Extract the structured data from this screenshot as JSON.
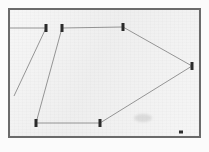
{
  "figure": {
    "kind": "scanned-survey-traverse-plot",
    "frame": {
      "x": 8,
      "y": 8,
      "width": 193,
      "height": 130,
      "border_color": "#6a6a6a",
      "border_width": 2
    },
    "background_color": "#ececec",
    "paper_color": "#fbfbfb",
    "line_color": "#8a8a8a",
    "node_color": "#2b2b2b"
  },
  "chart_data": {
    "type": "scatter",
    "title": "",
    "subtitle": "",
    "xlabel": "",
    "ylabel": "",
    "grid": false,
    "legend": null,
    "xlim": [
      0,
      209
    ],
    "ylim": [
      0,
      152
    ],
    "note": "Closed polygon traverse with station markers; coordinates are pixel positions in the scanned figure.",
    "nodes": [
      {
        "id": "A",
        "label": "",
        "x": 46,
        "y": 28
      },
      {
        "id": "B",
        "label": "",
        "x": 62,
        "y": 28
      },
      {
        "id": "C",
        "label": "",
        "x": 123,
        "y": 27
      },
      {
        "id": "D",
        "label": "",
        "x": 192,
        "y": 66
      },
      {
        "id": "E",
        "label": "",
        "x": 100,
        "y": 123
      },
      {
        "id": "F",
        "label": "",
        "x": 36,
        "y": 123
      }
    ],
    "edges": [
      {
        "from": "B",
        "to": "C"
      },
      {
        "from": "C",
        "to": "D"
      },
      {
        "from": "D",
        "to": "E"
      },
      {
        "from": "E",
        "to": "F"
      },
      {
        "from": "F",
        "to": "B"
      },
      {
        "from": "A",
        "to": "tail",
        "x2": 14,
        "y2": 96
      }
    ],
    "guide_lines": [
      {
        "from_x": 10,
        "from_y": 28,
        "to_x": 46,
        "to_y": 28,
        "name": "left-edge-tie-line"
      }
    ],
    "marks": [
      {
        "name": "corner-dot",
        "x": 181,
        "y": 132,
        "width": 4,
        "height": 3
      },
      {
        "name": "pencil-smudge",
        "x": 143,
        "y": 118,
        "width": 18,
        "height": 8
      }
    ]
  }
}
